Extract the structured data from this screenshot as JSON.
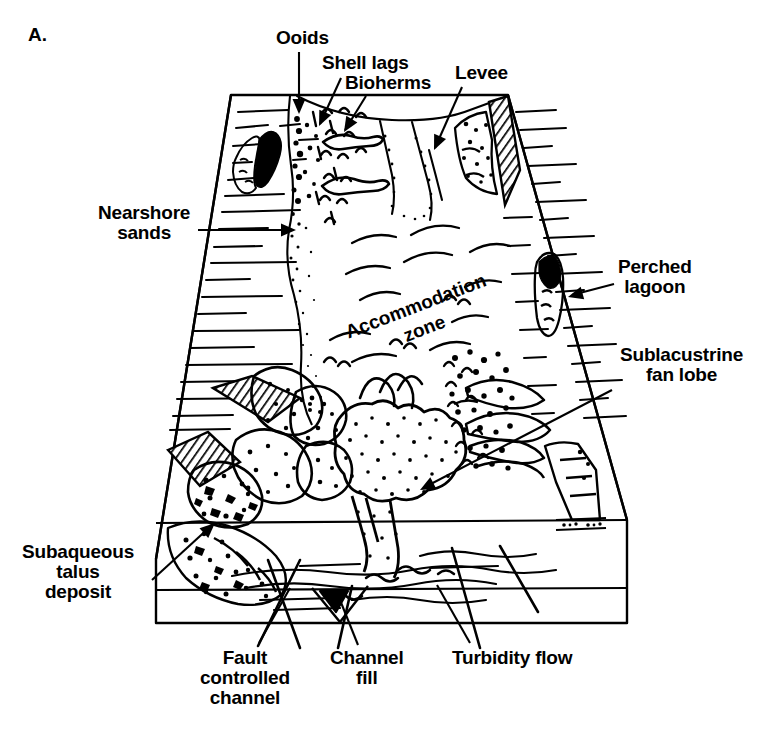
{
  "figure": {
    "panel_letter": "A.",
    "background_color": "#ffffff",
    "line_color": "#000000"
  },
  "annotations": [
    {
      "id": "ooids",
      "label": "Ooids",
      "lines": [
        "Ooids"
      ],
      "text_x": 276,
      "text_y": 28,
      "align": "left",
      "leader": [
        [
          299,
          52
        ],
        [
          299,
          112
        ]
      ],
      "arrow": "down",
      "target_x": 299,
      "target_y": 114
    },
    {
      "id": "shell-lags",
      "label": "Shell lags",
      "lines": [
        "Shell lags"
      ],
      "text_x": 322,
      "text_y": 53,
      "align": "left",
      "leader": [
        [
          341,
          78
        ],
        [
          320,
          124
        ]
      ],
      "arrow": "down",
      "target_x": 319,
      "target_y": 126
    },
    {
      "id": "bioherms",
      "label": "Bioherms",
      "lines": [
        "Bioherms"
      ],
      "text_x": 345,
      "text_y": 73,
      "align": "left",
      "leader": [
        [
          366,
          96
        ],
        [
          345,
          130
        ]
      ],
      "arrow": "down",
      "target_x": 344,
      "target_y": 132
    },
    {
      "id": "levee",
      "label": "Levee",
      "lines": [
        "Levee"
      ],
      "text_x": 455,
      "text_y": 63,
      "align": "left",
      "leader": [
        [
          462,
          87
        ],
        [
          435,
          148
        ]
      ],
      "arrow": "down",
      "target_x": 434,
      "target_y": 150
    },
    {
      "id": "nearshore-sands",
      "label": "Nearshore sands",
      "lines": [
        "Nearshore",
        "sands"
      ],
      "text_x": 98,
      "text_y": 203,
      "align": "left",
      "leader": [
        [
          198,
          230
        ],
        [
          292,
          230
        ]
      ],
      "arrow": "right",
      "target_x": 296,
      "target_y": 230
    },
    {
      "id": "perched-lagoon",
      "label": "Perched lagoon",
      "lines": [
        "Perched",
        "lagoon"
      ],
      "text_x": 618,
      "text_y": 257,
      "align": "left",
      "leader": [
        [
          614,
          284
        ],
        [
          572,
          295
        ]
      ],
      "arrow": "left",
      "target_x": 568,
      "target_y": 297
    },
    {
      "id": "sublacustrine-fan-lobe",
      "label": "Sublacustrine fan lobe",
      "lines": [
        "Sublacustrine",
        "fan lobe"
      ],
      "text_x": 620,
      "text_y": 345,
      "align": "left",
      "leader": [
        [
          612,
          390
        ],
        [
          425,
          487
        ]
      ],
      "arrow": "left-down",
      "target_x": 420,
      "target_y": 490
    },
    {
      "id": "subaqueous-talus-deposit",
      "label": "Subaqueous talus deposit",
      "lines": [
        "Subaqueous",
        "talus",
        "deposit"
      ],
      "text_x": 22,
      "text_y": 542,
      "align": "left",
      "leader": [
        [
          152,
          580
        ],
        [
          211,
          526
        ]
      ],
      "arrow": "up-right",
      "target_x": 215,
      "target_y": 523
    },
    {
      "id": "fault-controlled-channel",
      "label": "Fault controlled channel",
      "lines": [
        "Fault",
        "controlled",
        "channel"
      ],
      "text_x": 200,
      "text_y": 648,
      "align": "left",
      "leader": [
        [
          259,
          643
        ],
        [
          290,
          588
        ]
      ],
      "arrow": "none",
      "target_x": 290,
      "target_y": 588
    },
    {
      "id": "channel-fill",
      "label": "Channel fill",
      "lines": [
        "Channel",
        "fill"
      ],
      "text_x": 330,
      "text_y": 648,
      "align": "left",
      "leader": [
        [
          358,
          645
        ],
        [
          340,
          600
        ]
      ],
      "arrow": "none",
      "target_x": 340,
      "target_y": 600
    },
    {
      "id": "turbidity-flow",
      "label": "Turbidity flow",
      "lines": [
        "Turbidity flow"
      ],
      "text_x": 452,
      "text_y": 648,
      "align": "left",
      "leader": [
        [
          470,
          643
        ],
        [
          437,
          585
        ]
      ],
      "arrow": "none",
      "target_x": 437,
      "target_y": 585
    }
  ],
  "inset_labels": [
    {
      "id": "accommodation-zone",
      "lines": [
        "Accommodation",
        "zone"
      ],
      "x": 418,
      "y": 312,
      "rotation": -21,
      "font_size": 19
    }
  ]
}
